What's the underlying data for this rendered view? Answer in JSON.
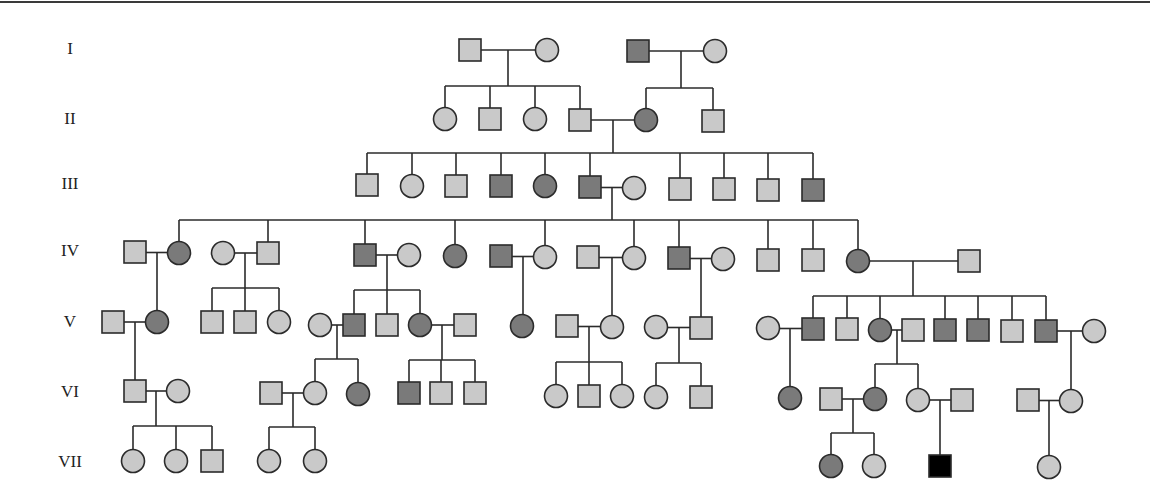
{
  "diagram": {
    "type": "pedigree",
    "colors": {
      "unaffected": "#c9c9c9",
      "affected_grey": "#7a7a7a",
      "affected_black": "#000000",
      "line": "#2b2b2b"
    },
    "generations": [
      {
        "label": "I",
        "y": 50
      },
      {
        "label": "II",
        "y": 120
      },
      {
        "label": "III",
        "y": 185
      },
      {
        "label": "IV",
        "y": 252
      },
      {
        "label": "V",
        "y": 323
      },
      {
        "label": "VI",
        "y": 393
      },
      {
        "label": "VII",
        "y": 463
      }
    ],
    "individuals": [
      {
        "id": "I-1",
        "gen": "I",
        "sex": "male",
        "status": "unaffected",
        "x": 470,
        "y": 50
      },
      {
        "id": "I-2",
        "gen": "I",
        "sex": "female",
        "status": "unaffected",
        "x": 547,
        "y": 50
      },
      {
        "id": "I-3",
        "gen": "I",
        "sex": "male",
        "status": "affected_grey",
        "x": 638,
        "y": 51
      },
      {
        "id": "I-4",
        "gen": "I",
        "sex": "female",
        "status": "unaffected",
        "x": 715,
        "y": 51
      },
      {
        "id": "II-1",
        "gen": "II",
        "sex": "female",
        "status": "unaffected",
        "x": 445,
        "y": 119
      },
      {
        "id": "II-2",
        "gen": "II",
        "sex": "male",
        "status": "unaffected",
        "x": 490,
        "y": 119
      },
      {
        "id": "II-3",
        "gen": "II",
        "sex": "female",
        "status": "unaffected",
        "x": 535,
        "y": 119
      },
      {
        "id": "II-4",
        "gen": "II",
        "sex": "male",
        "status": "unaffected",
        "x": 580,
        "y": 120
      },
      {
        "id": "II-5",
        "gen": "II",
        "sex": "female",
        "status": "affected_grey",
        "x": 646,
        "y": 120
      },
      {
        "id": "II-6",
        "gen": "II",
        "sex": "male",
        "status": "unaffected",
        "x": 713,
        "y": 121
      },
      {
        "id": "III-1",
        "gen": "III",
        "sex": "male",
        "status": "unaffected",
        "x": 367,
        "y": 185
      },
      {
        "id": "III-2",
        "gen": "III",
        "sex": "female",
        "status": "unaffected",
        "x": 412,
        "y": 186
      },
      {
        "id": "III-3",
        "gen": "III",
        "sex": "male",
        "status": "unaffected",
        "x": 456,
        "y": 186
      },
      {
        "id": "III-4",
        "gen": "III",
        "sex": "male",
        "status": "affected_grey",
        "x": 501,
        "y": 186
      },
      {
        "id": "III-5",
        "gen": "III",
        "sex": "female",
        "status": "affected_grey",
        "x": 545,
        "y": 186
      },
      {
        "id": "III-6",
        "gen": "III",
        "sex": "male",
        "status": "affected_grey",
        "x": 590,
        "y": 187
      },
      {
        "id": "III-7",
        "gen": "III",
        "sex": "female",
        "status": "unaffected",
        "x": 634,
        "y": 188
      },
      {
        "id": "III-8",
        "gen": "III",
        "sex": "male",
        "status": "unaffected",
        "x": 680,
        "y": 189
      },
      {
        "id": "III-9",
        "gen": "III",
        "sex": "male",
        "status": "unaffected",
        "x": 724,
        "y": 189
      },
      {
        "id": "III-10",
        "gen": "III",
        "sex": "male",
        "status": "unaffected",
        "x": 768,
        "y": 190
      },
      {
        "id": "III-11",
        "gen": "III",
        "sex": "male",
        "status": "affected_grey",
        "x": 813,
        "y": 190
      },
      {
        "id": "IV-1",
        "gen": "IV",
        "sex": "male",
        "status": "unaffected",
        "x": 135,
        "y": 252
      },
      {
        "id": "IV-2",
        "gen": "IV",
        "sex": "female",
        "status": "affected_grey",
        "x": 179,
        "y": 253
      },
      {
        "id": "IV-3",
        "gen": "IV",
        "sex": "female",
        "status": "unaffected",
        "x": 223,
        "y": 253
      },
      {
        "id": "IV-4",
        "gen": "IV",
        "sex": "male",
        "status": "unaffected",
        "x": 268,
        "y": 253
      },
      {
        "id": "IV-5",
        "gen": "IV",
        "sex": "male",
        "status": "affected_grey",
        "x": 365,
        "y": 255
      },
      {
        "id": "IV-6",
        "gen": "IV",
        "sex": "female",
        "status": "unaffected",
        "x": 409,
        "y": 255
      },
      {
        "id": "IV-7",
        "gen": "IV",
        "sex": "female",
        "status": "affected_grey",
        "x": 455,
        "y": 256
      },
      {
        "id": "IV-8",
        "gen": "IV",
        "sex": "male",
        "status": "affected_grey",
        "x": 501,
        "y": 256
      },
      {
        "id": "IV-9",
        "gen": "IV",
        "sex": "female",
        "status": "unaffected",
        "x": 545,
        "y": 257
      },
      {
        "id": "IV-10",
        "gen": "IV",
        "sex": "male",
        "status": "unaffected",
        "x": 588,
        "y": 257
      },
      {
        "id": "IV-11",
        "gen": "IV",
        "sex": "female",
        "status": "unaffected",
        "x": 634,
        "y": 258
      },
      {
        "id": "IV-12",
        "gen": "IV",
        "sex": "male",
        "status": "affected_grey",
        "x": 679,
        "y": 258
      },
      {
        "id": "IV-13",
        "gen": "IV",
        "sex": "female",
        "status": "unaffected",
        "x": 723,
        "y": 259
      },
      {
        "id": "IV-14",
        "gen": "IV",
        "sex": "male",
        "status": "unaffected",
        "x": 768,
        "y": 260
      },
      {
        "id": "IV-15",
        "gen": "IV",
        "sex": "male",
        "status": "unaffected",
        "x": 813,
        "y": 260
      },
      {
        "id": "IV-16",
        "gen": "IV",
        "sex": "female",
        "status": "affected_grey",
        "x": 858,
        "y": 261
      },
      {
        "id": "IV-17",
        "gen": "IV",
        "sex": "male",
        "status": "unaffected",
        "x": 969,
        "y": 261
      },
      {
        "id": "V-1",
        "gen": "V",
        "sex": "male",
        "status": "unaffected",
        "x": 113,
        "y": 322
      },
      {
        "id": "V-2",
        "gen": "V",
        "sex": "female",
        "status": "affected_grey",
        "x": 157,
        "y": 322
      },
      {
        "id": "V-3",
        "gen": "V",
        "sex": "male",
        "status": "unaffected",
        "x": 212,
        "y": 322
      },
      {
        "id": "V-4",
        "gen": "V",
        "sex": "male",
        "status": "unaffected",
        "x": 245,
        "y": 322
      },
      {
        "id": "V-5",
        "gen": "V",
        "sex": "female",
        "status": "unaffected",
        "x": 279,
        "y": 322
      },
      {
        "id": "V-6",
        "gen": "V",
        "sex": "female",
        "status": "unaffected",
        "x": 320,
        "y": 325
      },
      {
        "id": "V-7",
        "gen": "V",
        "sex": "male",
        "status": "affected_grey",
        "x": 354,
        "y": 325
      },
      {
        "id": "V-8",
        "gen": "V",
        "sex": "male",
        "status": "unaffected",
        "x": 387,
        "y": 325
      },
      {
        "id": "V-9",
        "gen": "V",
        "sex": "female",
        "status": "affected_grey",
        "x": 420,
        "y": 325
      },
      {
        "id": "V-10",
        "gen": "V",
        "sex": "male",
        "status": "unaffected",
        "x": 465,
        "y": 325
      },
      {
        "id": "V-11",
        "gen": "V",
        "sex": "female",
        "status": "affected_grey",
        "x": 522,
        "y": 326
      },
      {
        "id": "V-12",
        "gen": "V",
        "sex": "male",
        "status": "unaffected",
        "x": 567,
        "y": 326
      },
      {
        "id": "V-13",
        "gen": "V",
        "sex": "female",
        "status": "unaffected",
        "x": 612,
        "y": 327
      },
      {
        "id": "V-14",
        "gen": "V",
        "sex": "female",
        "status": "unaffected",
        "x": 656,
        "y": 327
      },
      {
        "id": "V-15",
        "gen": "V",
        "sex": "male",
        "status": "unaffected",
        "x": 701,
        "y": 328
      },
      {
        "id": "V-16",
        "gen": "V",
        "sex": "female",
        "status": "unaffected",
        "x": 768,
        "y": 328
      },
      {
        "id": "V-17",
        "gen": "V",
        "sex": "male",
        "status": "affected_grey",
        "x": 813,
        "y": 329
      },
      {
        "id": "V-18",
        "gen": "V",
        "sex": "male",
        "status": "unaffected",
        "x": 847,
        "y": 329
      },
      {
        "id": "V-19",
        "gen": "V",
        "sex": "female",
        "status": "affected_grey",
        "x": 880,
        "y": 330
      },
      {
        "id": "V-20",
        "gen": "V",
        "sex": "male",
        "status": "unaffected",
        "x": 913,
        "y": 330
      },
      {
        "id": "V-21",
        "gen": "V",
        "sex": "male",
        "status": "affected_grey",
        "x": 945,
        "y": 330
      },
      {
        "id": "V-22",
        "gen": "V",
        "sex": "male",
        "status": "affected_grey",
        "x": 978,
        "y": 330
      },
      {
        "id": "V-23",
        "gen": "V",
        "sex": "male",
        "status": "unaffected",
        "x": 1012,
        "y": 331
      },
      {
        "id": "V-24",
        "gen": "V",
        "sex": "male",
        "status": "affected_grey",
        "x": 1046,
        "y": 331
      },
      {
        "id": "V-25",
        "gen": "V",
        "sex": "female",
        "status": "unaffected",
        "x": 1094,
        "y": 331
      },
      {
        "id": "VI-1",
        "gen": "VI",
        "sex": "male",
        "status": "unaffected",
        "x": 135,
        "y": 391
      },
      {
        "id": "VI-2",
        "gen": "VI",
        "sex": "female",
        "status": "unaffected",
        "x": 178,
        "y": 391
      },
      {
        "id": "VI-3",
        "gen": "VI",
        "sex": "male",
        "status": "unaffected",
        "x": 271,
        "y": 393
      },
      {
        "id": "VI-4",
        "gen": "VI",
        "sex": "female",
        "status": "unaffected",
        "x": 315,
        "y": 393
      },
      {
        "id": "VI-5",
        "gen": "VI",
        "sex": "female",
        "status": "affected_grey",
        "x": 358,
        "y": 394
      },
      {
        "id": "VI-6",
        "gen": "VI",
        "sex": "male",
        "status": "affected_grey",
        "x": 409,
        "y": 393
      },
      {
        "id": "VI-7",
        "gen": "VI",
        "sex": "male",
        "status": "unaffected",
        "x": 441,
        "y": 393
      },
      {
        "id": "VI-8",
        "gen": "VI",
        "sex": "male",
        "status": "unaffected",
        "x": 475,
        "y": 393
      },
      {
        "id": "VI-9",
        "gen": "VI",
        "sex": "female",
        "status": "unaffected",
        "x": 556,
        "y": 396
      },
      {
        "id": "VI-10",
        "gen": "VI",
        "sex": "male",
        "status": "unaffected",
        "x": 589,
        "y": 396
      },
      {
        "id": "VI-11",
        "gen": "VI",
        "sex": "female",
        "status": "unaffected",
        "x": 622,
        "y": 396
      },
      {
        "id": "VI-12",
        "gen": "VI",
        "sex": "female",
        "status": "unaffected",
        "x": 656,
        "y": 397
      },
      {
        "id": "VI-13",
        "gen": "VI",
        "sex": "male",
        "status": "unaffected",
        "x": 701,
        "y": 397
      },
      {
        "id": "VI-14",
        "gen": "VI",
        "sex": "female",
        "status": "affected_grey",
        "x": 790,
        "y": 398
      },
      {
        "id": "VI-15",
        "gen": "VI",
        "sex": "male",
        "status": "unaffected",
        "x": 831,
        "y": 399
      },
      {
        "id": "VI-16",
        "gen": "VI",
        "sex": "female",
        "status": "affected_grey",
        "x": 875,
        "y": 399
      },
      {
        "id": "VI-17",
        "gen": "VI",
        "sex": "female",
        "status": "unaffected",
        "x": 918,
        "y": 400
      },
      {
        "id": "VI-18",
        "gen": "VI",
        "sex": "male",
        "status": "unaffected",
        "x": 962,
        "y": 400
      },
      {
        "id": "VI-19",
        "gen": "VI",
        "sex": "male",
        "status": "unaffected",
        "x": 1028,
        "y": 400
      },
      {
        "id": "VI-20",
        "gen": "VI",
        "sex": "female",
        "status": "unaffected",
        "x": 1071,
        "y": 401
      },
      {
        "id": "VII-1",
        "gen": "VII",
        "sex": "female",
        "status": "unaffected",
        "x": 133,
        "y": 461
      },
      {
        "id": "VII-2",
        "gen": "VII",
        "sex": "female",
        "status": "unaffected",
        "x": 176,
        "y": 461
      },
      {
        "id": "VII-3",
        "gen": "VII",
        "sex": "male",
        "status": "unaffected",
        "x": 212,
        "y": 461
      },
      {
        "id": "VII-4",
        "gen": "VII",
        "sex": "female",
        "status": "unaffected",
        "x": 269,
        "y": 461
      },
      {
        "id": "VII-5",
        "gen": "VII",
        "sex": "female",
        "status": "unaffected",
        "x": 315,
        "y": 461
      },
      {
        "id": "VII-6",
        "gen": "VII",
        "sex": "female",
        "status": "affected_grey",
        "x": 831,
        "y": 466
      },
      {
        "id": "VII-7",
        "gen": "VII",
        "sex": "female",
        "status": "unaffected",
        "x": 874,
        "y": 466
      },
      {
        "id": "VII-8",
        "gen": "VII",
        "sex": "male",
        "status": "affected_black",
        "x": 940,
        "y": 466
      },
      {
        "id": "VII-9",
        "gen": "VII",
        "sex": "female",
        "status": "unaffected",
        "x": 1049,
        "y": 467
      }
    ],
    "couples": [
      {
        "a": "I-1",
        "b": "I-2",
        "drop_x": 508,
        "children": [
          "II-1",
          "II-2",
          "II-3",
          "II-4"
        ],
        "sib_y": 86
      },
      {
        "a": "I-3",
        "b": "I-4",
        "drop_x": 681,
        "children": [
          "II-5",
          "II-6"
        ],
        "sib_y": 88
      },
      {
        "a": "II-4",
        "b": "II-5",
        "drop_x": 613,
        "children": [
          "III-1",
          "III-2",
          "III-3",
          "III-4",
          "III-5",
          "III-6",
          "III-8",
          "III-9",
          "III-10",
          "III-11"
        ],
        "sib_y": 153
      },
      {
        "a": "III-6",
        "b": "III-7",
        "drop_x": 612,
        "children": [
          "IV-2",
          "IV-4",
          "IV-5",
          "IV-7",
          "IV-9",
          "IV-11",
          "IV-12",
          "IV-14",
          "IV-15",
          "IV-16"
        ],
        "sib_y": 220
      },
      {
        "a": "IV-1",
        "b": "IV-2",
        "drop_x": 157,
        "children": [
          "V-2"
        ],
        "sib_y": null
      },
      {
        "a": "IV-3",
        "b": "IV-4",
        "drop_x": 245,
        "children": [
          "V-3",
          "V-4",
          "V-5"
        ],
        "sib_y": 288
      },
      {
        "a": "IV-5",
        "b": "IV-6",
        "drop_x": 387,
        "children": [
          "V-7",
          "V-8",
          "V-9"
        ],
        "sib_y": 290
      },
      {
        "a": "IV-8",
        "b": "IV-9",
        "drop_x": 523,
        "children": [
          "V-11"
        ],
        "sib_y": null
      },
      {
        "a": "IV-10",
        "b": "IV-11",
        "drop_x": 612,
        "children": [
          "V-13"
        ],
        "sib_y": null
      },
      {
        "a": "IV-12",
        "b": "IV-13",
        "drop_x": 701,
        "children": [
          "V-15"
        ],
        "sib_y": null
      },
      {
        "a": "IV-16",
        "b": "IV-17",
        "drop_x": 913,
        "children": [
          "V-17",
          "V-18",
          "V-19",
          "V-21",
          "V-22",
          "V-23",
          "V-24"
        ],
        "sib_y": 296
      },
      {
        "a": "V-1",
        "b": "V-2",
        "drop_x": 135,
        "children": [
          "VI-1"
        ],
        "sib_y": null
      },
      {
        "a": "V-6",
        "b": "V-7",
        "drop_x": 337,
        "children": [
          "VI-4",
          "VI-5"
        ],
        "sib_y": 359
      },
      {
        "a": "V-9",
        "b": "V-10",
        "drop_x": 442,
        "children": [
          "VI-6",
          "VI-7",
          "VI-8"
        ],
        "sib_y": 360
      },
      {
        "a": "V-12",
        "b": "V-13",
        "drop_x": 589,
        "children": [
          "VI-9",
          "VI-10",
          "VI-11"
        ],
        "sib_y": 362
      },
      {
        "a": "V-14",
        "b": "V-15",
        "drop_x": 679,
        "children": [
          "VI-12",
          "VI-13"
        ],
        "sib_y": 363
      },
      {
        "a": "V-16",
        "b": "V-17",
        "drop_x": 790,
        "children": [
          "VI-14"
        ],
        "sib_y": null
      },
      {
        "a": "V-19",
        "b": "V-20",
        "drop_x": 897,
        "children": [
          "VI-16",
          "VI-17"
        ],
        "sib_y": 364
      },
      {
        "a": "V-24",
        "b": "V-25",
        "drop_x": 1071,
        "children": [
          "VI-20"
        ],
        "sib_y": null
      },
      {
        "a": "VI-1",
        "b": "VI-2",
        "drop_x": 156,
        "children": [
          "VII-1",
          "VII-2",
          "VII-3"
        ],
        "sib_y": 426
      },
      {
        "a": "VI-3",
        "b": "VI-4",
        "drop_x": 293,
        "children": [
          "VII-4",
          "VII-5"
        ],
        "sib_y": 427
      },
      {
        "a": "VI-15",
        "b": "VI-16",
        "drop_x": 853,
        "children": [
          "VII-6",
          "VII-7"
        ],
        "sib_y": 433
      },
      {
        "a": "VI-17",
        "b": "VI-18",
        "drop_x": 940,
        "children": [
          "VII-8"
        ],
        "sib_y": null
      },
      {
        "a": "VI-19",
        "b": "VI-20",
        "drop_x": 1049,
        "children": [
          "VII-9"
        ],
        "sib_y": null
      }
    ]
  }
}
